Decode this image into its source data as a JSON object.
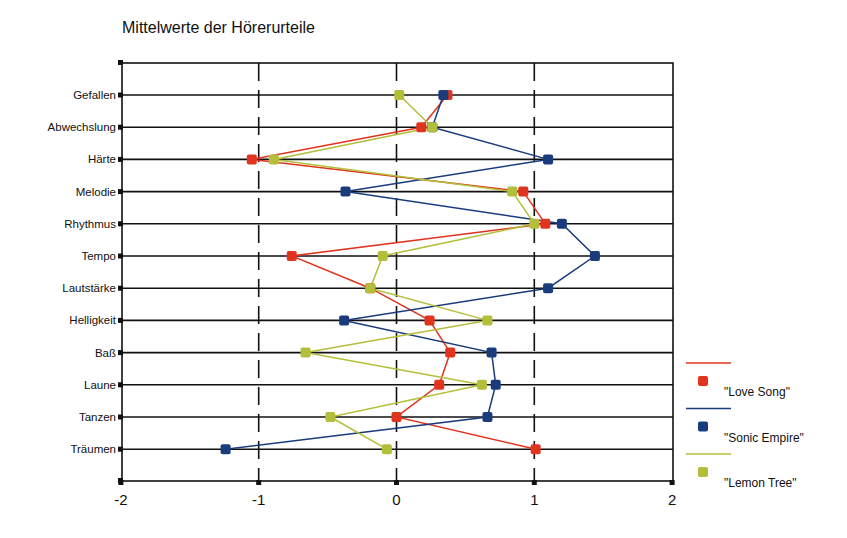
{
  "chart_data": {
    "type": "line",
    "orientation": "horizontal-profile",
    "title": "Mittelwerte der Hörerurteile",
    "xlabel": "",
    "ylabel": "",
    "xlim": [
      -2,
      2
    ],
    "xticks": [
      "-2",
      "-1",
      "0",
      "1",
      "2"
    ],
    "grid": {
      "vertical_dashed_at": [
        -1,
        0,
        1
      ],
      "horizontal_at_each_category": true
    },
    "categories": [
      "Gefallen",
      "Abwechslung",
      "Härte",
      "Melodie",
      "Rhythmus",
      "Tempo",
      "Lautstärke",
      "Helligkeit",
      "Baß",
      "Laune",
      "Tanzen",
      "Träumen"
    ],
    "series": [
      {
        "name": "\"Love Song\"",
        "color": "#e0341e",
        "values": [
          0.37,
          0.18,
          -1.05,
          0.92,
          1.08,
          -0.76,
          -0.19,
          0.24,
          0.39,
          0.31,
          0.0,
          1.01
        ]
      },
      {
        "name": "\"Sonic Empire\"",
        "color": "#1b3c7c",
        "values": [
          0.34,
          0.26,
          1.1,
          -0.37,
          1.2,
          1.44,
          1.1,
          -0.38,
          0.69,
          0.72,
          0.66,
          -1.24
        ]
      },
      {
        "name": "\"Lemon Tree\"",
        "color": "#b3bf3a",
        "values": [
          0.02,
          0.26,
          -0.89,
          0.84,
          1.0,
          -0.1,
          -0.19,
          0.66,
          -0.66,
          0.62,
          -0.48,
          -0.07
        ]
      }
    ],
    "legend_position": "right-bottom"
  }
}
